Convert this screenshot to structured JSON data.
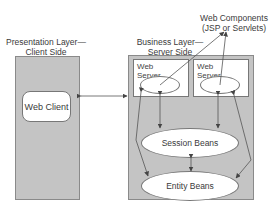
{
  "diagram": {
    "presentation_layer": {
      "title_line1": "Presentation Layer—",
      "title_line2": "Client Side",
      "web_client": "Web Client"
    },
    "business_layer": {
      "title_line1": "Business Layer—",
      "title_line2": "Server Side",
      "web_servers": [
        {
          "label": "Web\nServer"
        },
        {
          "label": "Web\nServer"
        }
      ],
      "session_beans": "Session Beans",
      "entity_beans": "Entity Beans"
    },
    "web_components": {
      "line1": "Web Components",
      "line2": "(JSP or Servlets)"
    },
    "colors": {
      "panel": "#c4c4c4",
      "box": "#ffffff",
      "line": "#555555"
    }
  }
}
